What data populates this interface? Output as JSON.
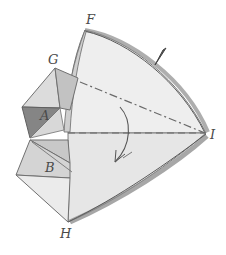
{
  "diagram": {
    "type": "folding-illustration",
    "labels": {
      "F": "F",
      "G": "G",
      "A": "A",
      "B": "B",
      "H": "H",
      "I": "I"
    },
    "colors": {
      "background": "#ffffff",
      "light_face": "#ececec",
      "mid_face": "#d2d2d2",
      "dark_face": "#8a8a8a",
      "edge": "#6a6a6a",
      "label": "#4a4a4a"
    },
    "annotations": {
      "axis_lines": [
        "G-I dash-dot line",
        "A-I dashed line"
      ],
      "rotation_arrow": "curved arrow indicating rotation around the axis",
      "pencil_mark": "small pencil stroke near upper edge"
    }
  }
}
